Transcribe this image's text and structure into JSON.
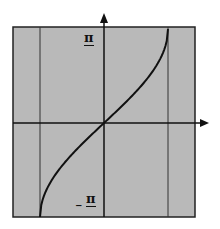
{
  "chart_data": {
    "type": "line",
    "title": "",
    "xlabel": "",
    "ylabel": "",
    "function_shape": "increasing curve through origin between two vertical lines",
    "x": [
      -1,
      -0.75,
      -0.5,
      -0.25,
      0,
      0.25,
      0.5,
      0.75,
      1
    ],
    "series": [
      {
        "name": "curve",
        "values": [
          -1.5708,
          -0.8481,
          -0.5236,
          -0.2527,
          0,
          0.2527,
          0.5236,
          0.8481,
          1.5708
        ]
      }
    ],
    "xlim": [
      -1.5,
      1.5
    ],
    "ylim": [
      -1.5708,
      1.5708
    ],
    "vertical_lines": [
      -1,
      1
    ],
    "y_tick_labels": {
      "top": "π",
      "bottom": "−π"
    },
    "grid": false,
    "background": "#b8b8b8",
    "line_color": "#111111"
  },
  "labels": {
    "top": "π",
    "bottom_sign": "_",
    "bottom": "π"
  }
}
